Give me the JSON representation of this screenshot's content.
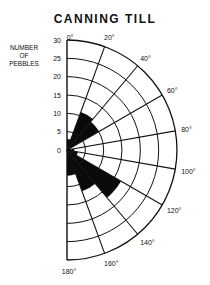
{
  "title": "CANNING TILL",
  "ylabel_lines": [
    "NUMBER",
    "OF",
    "PEBBLES"
  ],
  "chart_data": {
    "type": "rose",
    "title": "CANNING TILL",
    "ylabel": "NUMBER OF PEBBLES",
    "radial_ticks": [
      0,
      5,
      10,
      15,
      20,
      25,
      30
    ],
    "rlim": [
      0,
      30
    ],
    "angle_labels": [
      "0°",
      "20°",
      "40°",
      "60°",
      "80°",
      "100°",
      "120°",
      "140°",
      "160°",
      "180°"
    ],
    "categories": [
      "0-20°",
      "20-40°",
      "40-60°",
      "60-80°",
      "80-100°",
      "100-120°",
      "120-140°",
      "140-160°",
      "160-180°"
    ],
    "values": [
      3,
      11,
      10,
      1,
      2,
      3,
      17,
      12,
      7
    ],
    "grid": true
  }
}
